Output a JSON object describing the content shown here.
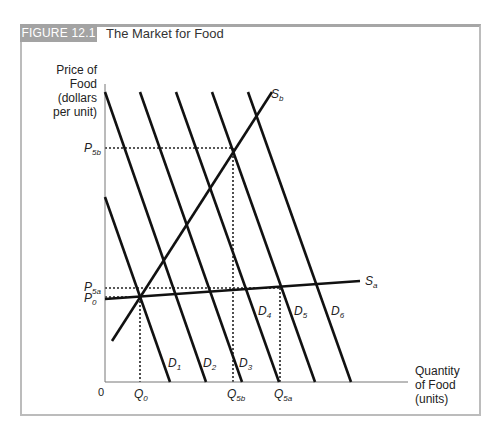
{
  "figure": {
    "badge": "FIGURE 12.1",
    "title": "The Market for Food"
  },
  "chart_data": {
    "type": "line",
    "title": "The Market for Food",
    "ylabel": [
      "Price of",
      "Food",
      "(dollars",
      "per unit)"
    ],
    "xlabel": [
      "Quantity",
      "of Food",
      "(units)"
    ],
    "origin_label": "0",
    "grid": false,
    "demand_curves": [
      {
        "name": "D1",
        "sub": "1",
        "from": [
          105,
          197
        ],
        "to": [
          170,
          382
        ]
      },
      {
        "name": "D2",
        "sub": "2",
        "from": [
          105,
          92
        ],
        "to": [
          206,
          382
        ]
      },
      {
        "name": "D3",
        "sub": "3",
        "from": [
          140,
          92
        ],
        "to": [
          242,
          382
        ]
      },
      {
        "name": "D4",
        "sub": "4",
        "from": [
          176,
          92
        ],
        "to": [
          279,
          382
        ]
      },
      {
        "name": "D5",
        "sub": "5",
        "from": [
          212,
          92
        ],
        "to": [
          315,
          382
        ]
      },
      {
        "name": "D6",
        "sub": "6",
        "from": [
          248,
          92
        ],
        "to": [
          351,
          382
        ]
      }
    ],
    "supply_curves": [
      {
        "name": "Sa",
        "sub": "a",
        "from": [
          105,
          299
        ],
        "to": [
          360,
          281
        ],
        "description": "elastic supply"
      },
      {
        "name": "Sb",
        "sub": "b",
        "from": [
          112,
          341
        ],
        "to": [
          272,
          92
        ],
        "description": "inelastic supply"
      }
    ],
    "price_markers": [
      {
        "label": "P",
        "sub": "5b",
        "y": 148
      },
      {
        "label": "P",
        "sub": "5a",
        "y": 288
      },
      {
        "label": "P",
        "sub": "0",
        "y": 297
      }
    ],
    "quantity_markers": [
      {
        "label": "Q",
        "sub": "0",
        "x": 140
      },
      {
        "label": "Q",
        "sub": "5b",
        "x": 233
      },
      {
        "label": "Q",
        "sub": "5a",
        "x": 280
      }
    ],
    "equilibria": [
      {
        "name": "initial",
        "price": "P0",
        "quantity": "Q0",
        "point": [
          140,
          297
        ]
      },
      {
        "name": "D5 with Sb",
        "price": "P5b",
        "quantity": "Q5b",
        "point": [
          233,
          148
        ]
      },
      {
        "name": "D5 with Sa",
        "price": "P5a",
        "quantity": "Q5a",
        "point": [
          280,
          288
        ]
      }
    ]
  }
}
